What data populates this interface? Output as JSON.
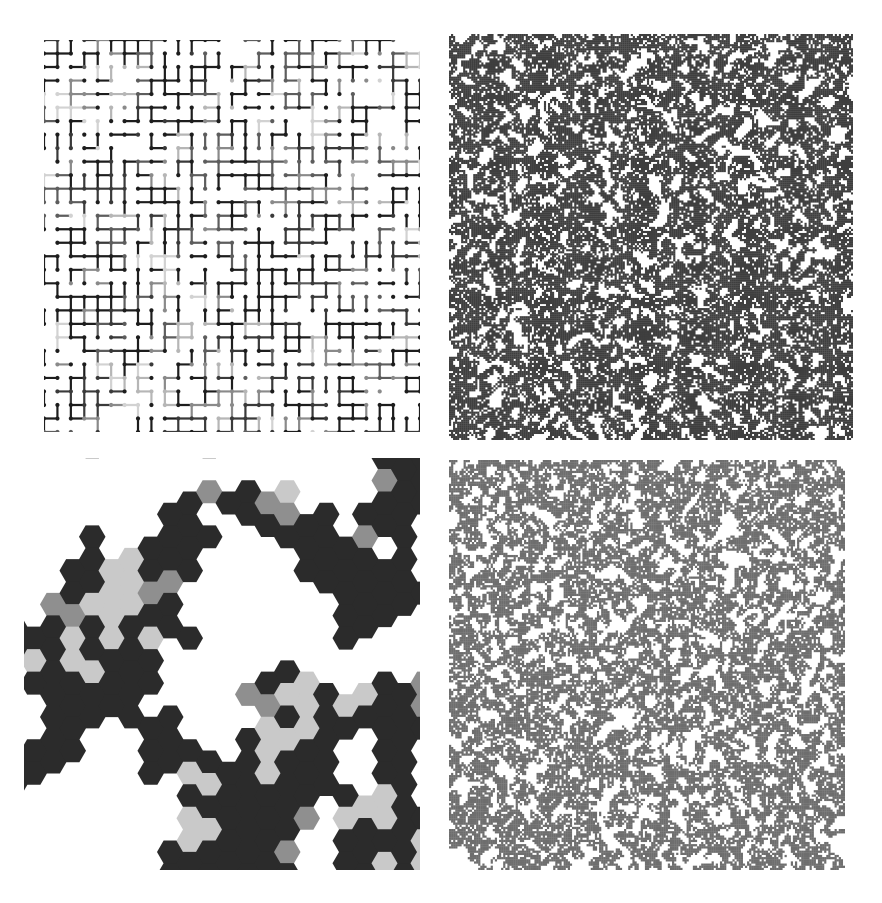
{
  "figure": {
    "title": "",
    "background_color": "#ffffff",
    "width": 882,
    "height": 903,
    "layout": "2x2-grid-of-panels",
    "panel_count": 4
  },
  "panels": [
    {
      "id": "bond-percolation-lattice",
      "position": "top-left",
      "caption": "",
      "type": "bond-percolation-square-lattice",
      "x": 44,
      "y": 40,
      "width": 376,
      "height": 392,
      "grid_cols": 29,
      "grid_rows": 30,
      "spacing": 13,
      "node_radius": 2.1,
      "bond_thickness": 2.2,
      "bond_probability": 0.5,
      "node_probability": 0.62,
      "seed": 20477,
      "colors": [
        "#1d1d1d",
        "#3a3a3a",
        "#5d5d5d",
        "#8a8a8a",
        "#b6b6b6",
        "#d2d2d2"
      ],
      "color_weights": [
        0.42,
        0.18,
        0.12,
        0.12,
        0.09,
        0.07
      ]
    },
    {
      "id": "site-percolation-critical",
      "position": "top-right",
      "caption": "",
      "type": "site-percolation-square-lattice",
      "x": 449,
      "y": 34,
      "width": 404,
      "height": 406,
      "cells": 200,
      "occupancy": 0.593,
      "smoothing_passes": 2,
      "smoothing_strength": 0.52,
      "seed": 90311,
      "fill_color": "#3f3f3f",
      "background_color": "#ffffff"
    },
    {
      "id": "hexagonal-site-percolation",
      "position": "bottom-left",
      "caption": "",
      "type": "site-percolation-hexagonal-lattice",
      "x": 24,
      "y": 458,
      "width": 396,
      "height": 412,
      "hex_radius": 13.0,
      "hex_cols": 18,
      "hex_rows": 17,
      "occupancy": 0.5,
      "smoothing_passes": 2,
      "smoothing_strength": 0.55,
      "seed": 7731,
      "colors": [
        "#2b2b2b",
        "#8f8f8f",
        "#c9c9c9"
      ],
      "color_weights": [
        0.78,
        0.1,
        0.12
      ],
      "background_color": "#ffffff"
    },
    {
      "id": "incipient-spanning-cluster",
      "position": "bottom-right",
      "caption": "",
      "type": "site-percolation-spanning-cluster",
      "x": 449,
      "y": 460,
      "width": 396,
      "height": 410,
      "cells": 190,
      "occupancy": 0.58,
      "smoothing_passes": 2,
      "smoothing_strength": 0.5,
      "seed": 44219,
      "fill_color": "#6e6e6e",
      "background_color": "#ffffff",
      "cluster_selection": "largest-connected-component"
    }
  ],
  "chart_data": {
    "type": "heatmap",
    "title": "",
    "xlabel": "",
    "ylabel": "",
    "legend": [],
    "grid": false,
    "series": [
      {
        "name": "bond percolation on square lattice",
        "panel": "top-left",
        "description": "Square lattice with open bonds drawn as thick segments joining filled nodes; bond shading varies from black to light gray indicating distinct clusters.",
        "parameters": {
          "p_bond": 0.5,
          "lattice": "square",
          "L": 29
        }
      },
      {
        "name": "site percolation at criticality",
        "panel": "top-right",
        "description": "Dense speckled occupied-site configuration near the critical threshold with large connected dark regions and white voids.",
        "parameters": {
          "p_site": 0.593,
          "lattice": "square",
          "L": 200
        }
      },
      {
        "name": "site percolation on triangular/hexagonal lattice",
        "panel": "bottom-left",
        "description": "Hexagonal cells coloured black, mid-gray and light-gray by cluster; black cluster spans the panel.",
        "parameters": {
          "p_site": 0.5,
          "lattice": "hexagonal",
          "L": 18
        }
      },
      {
        "name": "incipient spanning cluster",
        "panel": "bottom-right",
        "description": "Single largest connected cluster extracted from a critical site-percolation configuration, drawn mid-gray on white, spanning top to bottom.",
        "parameters": {
          "p_site": 0.58,
          "lattice": "square",
          "L": 190
        }
      }
    ]
  }
}
